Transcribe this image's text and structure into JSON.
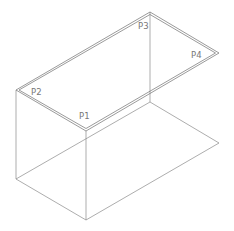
{
  "diagram": {
    "type": "isometric-box",
    "labels": {
      "p1": "P1",
      "p2": "P2",
      "p3": "P3",
      "p4": "P4"
    },
    "colors": {
      "line": "#8a8a8a",
      "label": "#777777",
      "background": "#ffffff"
    }
  }
}
